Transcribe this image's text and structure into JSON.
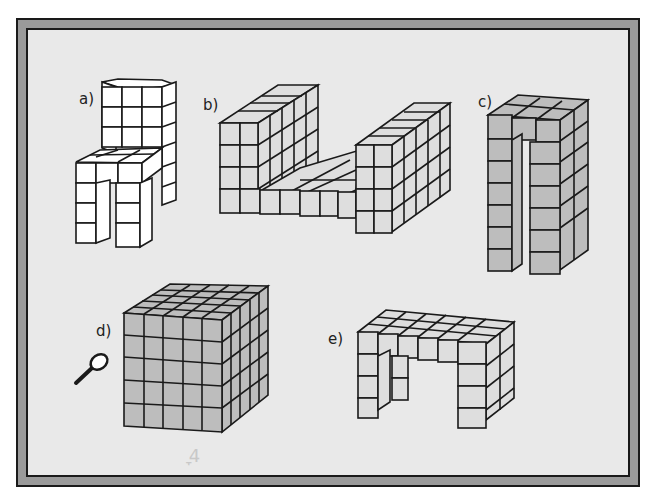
{
  "figure": {
    "colors": {
      "frame_border": "#9a9a9a",
      "panel_background": "#e9e9e9",
      "cube_white": "#ffffff",
      "cube_light_gray": "#dedede",
      "cube_gray": "#bdbdbd",
      "outline": "#1a1a1a"
    },
    "structures": [
      {
        "label": "a)",
        "description": "chair of white cubes",
        "fill": "white"
      },
      {
        "label": "b)",
        "description": "U-shaped wall structure of light gray cubes",
        "fill": "light-gray"
      },
      {
        "label": "c)",
        "description": "tall arch of gray cubes",
        "fill": "gray"
      },
      {
        "label": "d)",
        "description": "5x5x5 cube of gray cubes",
        "fill": "gray"
      },
      {
        "label": "e)",
        "description": "table of light gray cubes",
        "fill": "light-gray"
      }
    ],
    "magnifier_icon": "magnifying-glass-icon",
    "faint_marks": "ׇ 4"
  }
}
